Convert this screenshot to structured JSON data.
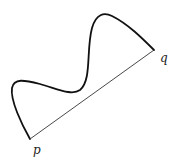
{
  "diagram": {
    "labels": {
      "p": "p",
      "q": "q"
    },
    "points": {
      "p": [
        30,
        139
      ],
      "q": [
        154,
        50
      ]
    },
    "curve": {
      "description": "wavy curve from p to q",
      "color": "#111111"
    },
    "segment": {
      "description": "straight line segment from p to q",
      "color": "#333333"
    }
  }
}
